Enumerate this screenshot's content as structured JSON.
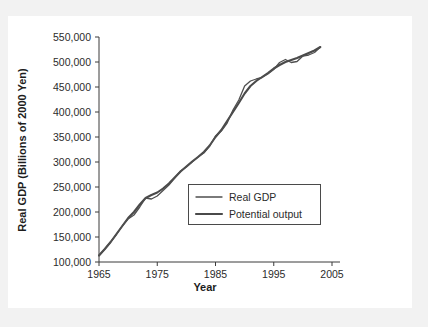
{
  "chart_data": {
    "type": "line",
    "title": "",
    "xlabel": "Year",
    "ylabel": "Real GDP (Billions of 2000 Yen)",
    "xlim": [
      1965,
      2005
    ],
    "ylim": [
      100000,
      550000
    ],
    "xticks": [
      "1965",
      "1975",
      "1985",
      "1995",
      "2005"
    ],
    "xtick_values": [
      1965,
      1975,
      1985,
      1995,
      2005
    ],
    "yticks": [
      "100,000",
      "150,000",
      "200,000",
      "250,000",
      "300,000",
      "350,000",
      "400,000",
      "450,000",
      "500,000",
      "550,000"
    ],
    "ytick_values": [
      100000,
      150000,
      200000,
      250000,
      300000,
      350000,
      400000,
      450000,
      500000,
      550000
    ],
    "grid": false,
    "legend_position": "center-right",
    "x": [
      1965,
      1966,
      1967,
      1968,
      1969,
      1970,
      1971,
      1972,
      1973,
      1974,
      1975,
      1976,
      1977,
      1978,
      1979,
      1980,
      1981,
      1982,
      1983,
      1984,
      1985,
      1986,
      1987,
      1988,
      1989,
      1990,
      1991,
      1992,
      1993,
      1994,
      1995,
      1996,
      1997,
      1998,
      1999,
      2000,
      2001,
      2002,
      2003
    ],
    "series": [
      {
        "name": "Real GDP",
        "color": "#4f4f4f",
        "values": [
          113000,
          126000,
          140000,
          155000,
          172000,
          186000,
          194000,
          210000,
          228000,
          226000,
          232000,
          243000,
          254000,
          268000,
          282000,
          290000,
          300000,
          310000,
          318000,
          332000,
          352000,
          362000,
          378000,
          404000,
          424000,
          452000,
          462000,
          466000,
          469000,
          476000,
          485000,
          499000,
          505000,
          499000,
          501000,
          512000,
          514000,
          519000,
          530000
        ]
      },
      {
        "name": "Potential output",
        "color": "#4a4a4a",
        "values": [
          113000,
          126000,
          140000,
          156000,
          172000,
          188000,
          200000,
          215000,
          228000,
          234000,
          239000,
          247000,
          257000,
          269000,
          281000,
          291000,
          301000,
          310000,
          320000,
          333000,
          350000,
          364000,
          382000,
          400000,
          418000,
          437000,
          452000,
          462000,
          470000,
          478000,
          487000,
          494000,
          500000,
          504000,
          508000,
          513000,
          518000,
          523000,
          530000
        ]
      }
    ],
    "legend": [
      {
        "label": "Real GDP",
        "color": "#4f4f4f",
        "width": 1.3
      },
      {
        "label": "Potential output",
        "color": "#4a4a4a",
        "width": 2.1
      }
    ]
  }
}
